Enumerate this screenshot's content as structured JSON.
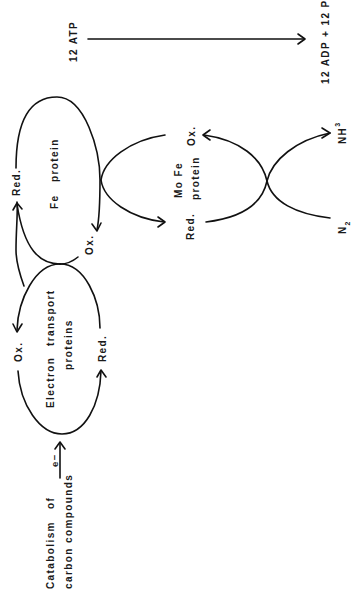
{
  "colors": {
    "background": "#ffffff",
    "ink": "#111111"
  },
  "atp": {
    "input_label": "12 ATP",
    "output_label": "12 ADP + 12 Pi"
  },
  "fe_protein": {
    "name_line1": "Fe",
    "name_line2": "protein",
    "reduced_label": "Red.",
    "oxidized_label": "Ox."
  },
  "electron_transport": {
    "name_line1": "Electron",
    "name_line2": "transport",
    "name_line3": "proteins",
    "oxidized_label": "Ox.",
    "reduced_label": "Red."
  },
  "mofe_protein": {
    "name_line1": "Mo Fe",
    "name_line2": "protein",
    "oxidized_label": "Ox.",
    "reduced_label": "Red."
  },
  "nitrogen": {
    "substrate_main": "N",
    "substrate_sub": "2",
    "product_main": "NH",
    "product_sub": "3"
  },
  "source": {
    "line1_a": "Catabolism",
    "line1_b": "of",
    "line2": "carbon compounds",
    "electron_label": "e−"
  }
}
